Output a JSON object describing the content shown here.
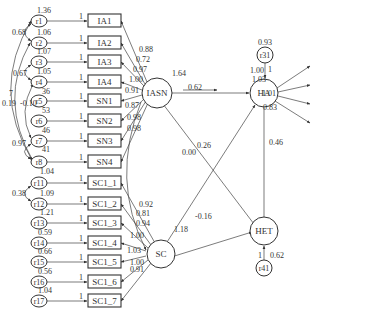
{
  "diagram": {
    "type": "structural-equation-model",
    "latent_factors": [
      {
        "id": "IASN",
        "label": "IASN",
        "variance": "1.64"
      },
      {
        "id": "SC",
        "label": "SC"
      },
      {
        "id": "HA",
        "label": "HA"
      },
      {
        "id": "HET",
        "label": "HET"
      }
    ],
    "left_indicators": [
      {
        "label": "IA1",
        "error": "r1",
        "error_var": "1.36",
        "path": "1",
        "loading": "0.88"
      },
      {
        "label": "IA2",
        "error": "r2",
        "error_var": "1.06",
        "path": "1",
        "loading": "0.72"
      },
      {
        "label": "IA3",
        "error": "r3",
        "error_var": "1.07",
        "path": "1",
        "loading": "0.97"
      },
      {
        "label": "IA4",
        "error": "r4",
        "error_var": "1.05",
        "path": "1",
        "loading": "1.00"
      },
      {
        "label": "SN1",
        "error": "r5",
        "error_var": "36",
        "path": "1",
        "loading": "0.91"
      },
      {
        "label": "SN2",
        "error": "r6",
        "error_var": "53",
        "path": "1",
        "loading": "0.87"
      },
      {
        "label": "SN3",
        "error": "r7",
        "error_var": "46",
        "path": "1",
        "loading": "0.98"
      },
      {
        "label": "SN4",
        "error": "r8",
        "error_var": "41",
        "path": "1",
        "loading": "0.98"
      },
      {
        "label": "SC1_1",
        "error": "r11",
        "error_var": "1.04",
        "path": "1",
        "loading": "0.92"
      },
      {
        "label": "SC1_2",
        "error": "r12",
        "error_var": "1.09",
        "path": "1",
        "loading": "0.81"
      },
      {
        "label": "SC1_3",
        "error": "r13",
        "error_var": "1.21",
        "path": "1",
        "loading": "0.94"
      },
      {
        "label": "SC1_4",
        "error": "r14",
        "error_var": "0.59",
        "path": "1",
        "loading": "1.00"
      },
      {
        "label": "SC1_5",
        "error": "r15",
        "error_var": "0.66",
        "path": "1",
        "loading": "1.03"
      },
      {
        "label": "SC1_6",
        "error": "r16",
        "error_var": "0.56",
        "path": "1",
        "loading": "1.00"
      },
      {
        "label": "SC1_7",
        "error": "r17",
        "error_var": "1.04",
        "path": "1",
        "loading": "0.91"
      }
    ],
    "left_covariances": [
      {
        "between": "r1-r2",
        "value": "0.68"
      },
      {
        "between": "r3-r4",
        "value": "0.67"
      },
      {
        "between": "r4-r7",
        "value": "-0.10"
      },
      {
        "between": "r1-r8",
        "value": "0.19",
        "extra": "7"
      },
      {
        "between": "r7-r8",
        "value": "0.97"
      },
      {
        "between": "r11-r12",
        "value": "0.38"
      }
    ],
    "right_indicators_ha": [
      {
        "label": "HA1_1",
        "error": "r21",
        "error_var": "0.45",
        "path": "1",
        "loading": "1.00"
      },
      {
        "label": "HA1_2",
        "error": "r22",
        "error_var": "0.15",
        "path": "1",
        "loading": "1.03"
      },
      {
        "label": "HA1_3",
        "error": "r23",
        "error_var": "0.36",
        "path": "1",
        "loading": "1.01"
      },
      {
        "label": "HA1_4",
        "error": "r24",
        "error_var": "1.03",
        "path": "1",
        "loading": "0.83"
      }
    ],
    "right_indicators_het": [
      {
        "label": "HET1_1",
        "error": "r25",
        "error_var": "0.58",
        "path": "1",
        "loading": "1.00"
      },
      {
        "label": "HET1_2",
        "error": "r26",
        "error_var": "0.29",
        "path": "1",
        "loading": "1.17"
      },
      {
        "label": "HET1_3",
        "error": "r27",
        "error_var": "0.30",
        "path": "1",
        "loading": "1.14"
      },
      {
        "label": "HET1_4",
        "error": "r28",
        "error_var": "1.36",
        "path": "1",
        "loading": "0.94"
      },
      {
        "label": "HET1_5",
        "error": "r29",
        "error_var": "0.91",
        "path": "1",
        "loading": "0.86"
      }
    ],
    "right_covariances": [
      {
        "between": "r26-r29",
        "value": "-0.13"
      },
      {
        "between": "r26-r28",
        "value": "1.06"
      }
    ],
    "disturbances": [
      {
        "id": "r31",
        "target": "HA",
        "variance": "0.93",
        "path": "1"
      },
      {
        "id": "r41",
        "target": "HET",
        "variance": "0.62",
        "path": "1"
      }
    ],
    "structural_paths": [
      {
        "from": "IASN",
        "to": "HA",
        "value": "0.62"
      },
      {
        "from": "IASN",
        "to": "HET",
        "value": "0.26"
      },
      {
        "from": "SC",
        "to": "HA",
        "value": "0.00"
      },
      {
        "from": "SC",
        "to": "HET",
        "value": "-0.16"
      },
      {
        "from": "HA",
        "to": "HET",
        "value": "0.46"
      },
      {
        "from": "IASN",
        "to": "SC",
        "value": "1.18"
      }
    ]
  }
}
